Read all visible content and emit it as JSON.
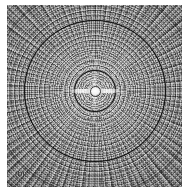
{
  "figure": {
    "panel_tag": "(b)",
    "type": "grayscale-contour-raster",
    "background_color": "#949494",
    "margin_color": "#ffffff"
  },
  "labels": {
    "inner_contour": "40 dB",
    "outer_contour": "20 dB"
  },
  "icons": {
    "focus_point": "focal-hotspot",
    "mesh": "polar-radial-mesh"
  },
  "chart_data": {
    "type": "heatmap",
    "title": "",
    "subtitle": "",
    "xlabel": "",
    "ylabel": "",
    "panel_label": "(b)",
    "grid": true,
    "legend_position": "none",
    "projection": "polar",
    "colormap": "grayscale",
    "center": {
      "x": 0,
      "y": 0,
      "description": "bright focal point / main lobe peak"
    },
    "mesh": {
      "description": "dense polar computational mesh of concentric circles and radial spokes",
      "radial_rings": 48,
      "angular_spokes": 100
    },
    "contours": [
      {
        "label": "40 dB",
        "value": 40,
        "unit": "dB",
        "radius_px": 20,
        "stroke": "#0a0a0a",
        "label_position": "below-center"
      },
      {
        "label": "20 dB",
        "value": 20,
        "unit": "dB",
        "radius_px": 70,
        "stroke": "#0a0a0a",
        "label_position": "below-center"
      }
    ],
    "faint_arcs": [
      {
        "radius_px": 103,
        "value": null
      },
      {
        "radius_px": 125,
        "value": null
      }
    ],
    "intensity_profile": {
      "description": "monotonic falloff from bright central peak to dark outer corners",
      "peak_normalized": 1.0,
      "edge_normalized": 0.25
    }
  }
}
